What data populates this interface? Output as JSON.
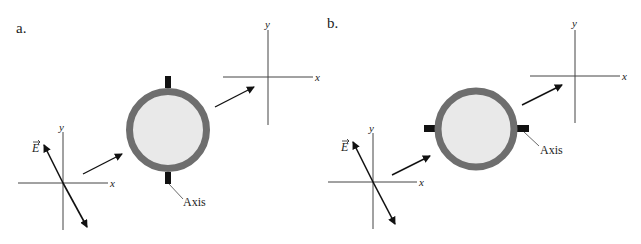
{
  "panels": [
    {
      "label": "a.",
      "incoming_axes": {
        "x_label": "x",
        "y_label": "y"
      },
      "field_label": "E",
      "axis_callout": "Axis",
      "axis_orientation": "vertical",
      "outgoing_axes": {
        "x_label": "x",
        "y_label": "y"
      }
    },
    {
      "label": "b.",
      "incoming_axes": {
        "x_label": "x",
        "y_label": "y"
      },
      "field_label": "E",
      "axis_callout": "Axis",
      "axis_orientation": "horizontal",
      "outgoing_axes": {
        "x_label": "x",
        "y_label": "y"
      }
    }
  ],
  "colors": {
    "ring": "#6e6e6e",
    "fill": "#e9e9e9",
    "peg": "#111111",
    "line": "#333333"
  }
}
